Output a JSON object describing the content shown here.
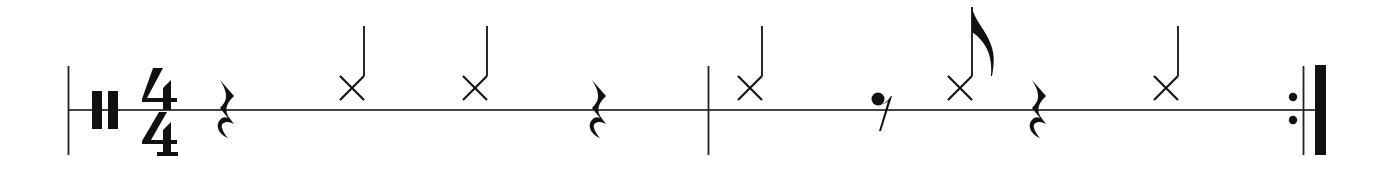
{
  "score": {
    "instrument": "percussion",
    "clef": "percussion",
    "time_signature": {
      "numerator": "4",
      "denominator": "4"
    },
    "ink_color": "#111111",
    "staff_line_color": "#444444",
    "measures": [
      {
        "number": 1,
        "events": [
          {
            "type": "rest",
            "duration": "quarter"
          },
          {
            "type": "note",
            "notehead": "x",
            "duration": "quarter"
          },
          {
            "type": "note",
            "notehead": "x",
            "duration": "quarter"
          },
          {
            "type": "rest",
            "duration": "quarter"
          }
        ]
      },
      {
        "number": 2,
        "events": [
          {
            "type": "note",
            "notehead": "x",
            "duration": "quarter"
          },
          {
            "type": "rest",
            "duration": "eighth"
          },
          {
            "type": "note",
            "notehead": "x",
            "duration": "eighth"
          },
          {
            "type": "rest",
            "duration": "quarter"
          },
          {
            "type": "note",
            "notehead": "x",
            "duration": "quarter"
          }
        ],
        "end_barline": "repeat-end"
      }
    ]
  }
}
